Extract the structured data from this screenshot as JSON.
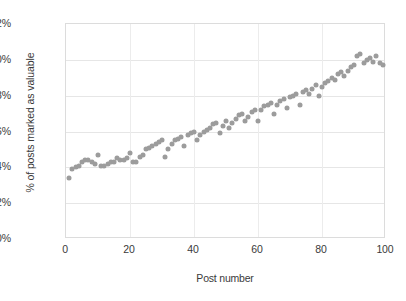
{
  "chart_data": {
    "type": "scatter",
    "title": "",
    "xlabel": "Post number",
    "ylabel": "% of posts marked as valuable",
    "xlim": [
      0,
      100
    ],
    "ylim": [
      0,
      12
    ],
    "grid": true,
    "legend": null,
    "y_tick_labels": [
      "0%",
      "2%",
      "4%",
      "6%",
      "8%",
      "10%",
      "12%"
    ],
    "y_tick_values": [
      0,
      2,
      4,
      6,
      8,
      10,
      12
    ],
    "x_tick_labels": [
      "0",
      "20",
      "40",
      "60",
      "80",
      "100"
    ],
    "x_tick_values": [
      0,
      20,
      40,
      60,
      80,
      100
    ],
    "marker_color": "#9c9c9c",
    "marker_shape": "circle",
    "series": [
      {
        "name": "% of posts marked as valuable",
        "x": [
          1,
          2,
          3,
          4,
          5,
          6,
          7,
          8,
          9,
          10,
          11,
          12,
          13,
          14,
          15,
          16,
          17,
          18,
          19,
          20,
          21,
          22,
          23,
          24,
          25,
          26,
          27,
          28,
          29,
          30,
          31,
          32,
          33,
          34,
          35,
          36,
          37,
          38,
          39,
          40,
          41,
          42,
          43,
          44,
          45,
          46,
          47,
          48,
          49,
          50,
          51,
          52,
          53,
          54,
          55,
          56,
          57,
          58,
          59,
          60,
          61,
          62,
          63,
          64,
          65,
          66,
          67,
          68,
          69,
          70,
          71,
          72,
          73,
          74,
          75,
          76,
          77,
          78,
          79,
          80,
          81,
          82,
          83,
          84,
          85,
          86,
          87,
          88,
          89,
          90,
          91,
          92,
          93,
          94,
          95,
          96,
          97,
          98,
          99
        ],
        "y": [
          3.4,
          3.9,
          4.0,
          4.1,
          4.3,
          4.4,
          4.4,
          4.3,
          4.2,
          4.7,
          4.1,
          4.1,
          4.2,
          4.3,
          4.3,
          4.5,
          4.4,
          4.4,
          4.5,
          4.8,
          4.3,
          4.3,
          4.6,
          4.7,
          5.0,
          5.1,
          5.2,
          5.3,
          5.4,
          5.5,
          4.6,
          5.0,
          5.3,
          5.5,
          5.6,
          5.7,
          5.2,
          5.8,
          5.9,
          6.0,
          5.5,
          5.8,
          6.0,
          6.1,
          6.2,
          6.4,
          6.5,
          5.9,
          6.3,
          6.6,
          6.2,
          6.5,
          6.7,
          6.9,
          7.0,
          6.6,
          6.8,
          7.1,
          7.2,
          6.6,
          7.2,
          7.4,
          7.5,
          7.6,
          7.0,
          7.5,
          7.7,
          7.8,
          7.3,
          7.9,
          8.0,
          8.1,
          7.5,
          8.2,
          8.3,
          8.1,
          8.4,
          8.6,
          8.0,
          8.5,
          8.7,
          8.8,
          9.0,
          8.9,
          9.2,
          9.3,
          9.1,
          9.4,
          9.6,
          9.7,
          10.2,
          10.3,
          9.8,
          10.0,
          10.1,
          9.9,
          10.2,
          9.8,
          9.7
        ]
      }
    ]
  }
}
